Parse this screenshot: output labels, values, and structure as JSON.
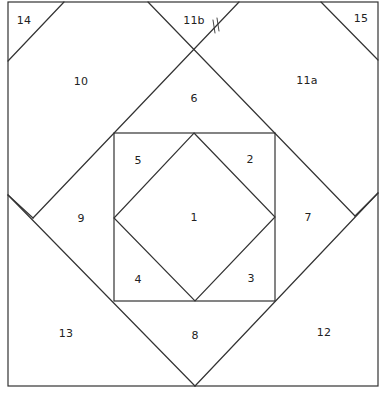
{
  "diagram": {
    "type": "quilt-paper-piecing-pattern",
    "line_color": "#333333",
    "background": "#ffffff",
    "pieces": [
      {
        "id": "1",
        "label": "1",
        "x": 194,
        "y": 217
      },
      {
        "id": "2",
        "label": "2",
        "x": 250,
        "y": 159
      },
      {
        "id": "3",
        "label": "3",
        "x": 251,
        "y": 278
      },
      {
        "id": "4",
        "label": "4",
        "x": 138,
        "y": 279
      },
      {
        "id": "5",
        "label": "5",
        "x": 138,
        "y": 160
      },
      {
        "id": "6",
        "label": "6",
        "x": 194,
        "y": 98
      },
      {
        "id": "7",
        "label": "7",
        "x": 308,
        "y": 217
      },
      {
        "id": "8",
        "label": "8",
        "x": 195,
        "y": 335
      },
      {
        "id": "9",
        "label": "9",
        "x": 81,
        "y": 218
      },
      {
        "id": "10",
        "label": "10",
        "x": 81,
        "y": 81
      },
      {
        "id": "11a",
        "label": "11a",
        "x": 307,
        "y": 80
      },
      {
        "id": "11b",
        "label": "11b",
        "x": 194,
        "y": 20
      },
      {
        "id": "12",
        "label": "12",
        "x": 324,
        "y": 332
      },
      {
        "id": "13",
        "label": "13",
        "x": 66,
        "y": 333
      },
      {
        "id": "14",
        "label": "14",
        "x": 24,
        "y": 20
      },
      {
        "id": "15",
        "label": "15",
        "x": 361,
        "y": 18
      }
    ],
    "seam_mark": {
      "symbol": "//",
      "x": 215,
      "y": 27
    }
  }
}
